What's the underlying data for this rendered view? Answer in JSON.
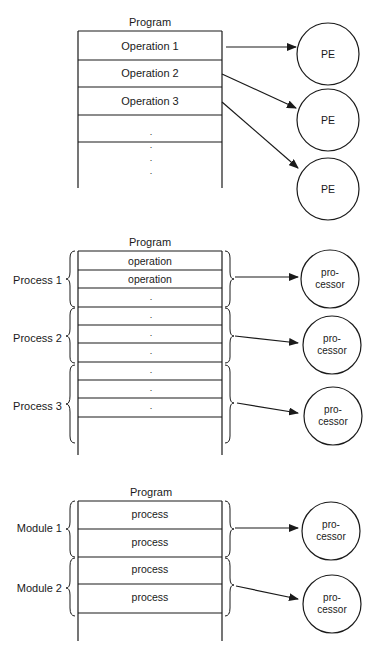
{
  "figure1": {
    "title": "Program",
    "rows": [
      "Operation 1",
      "Operation 2",
      "Operation 3",
      ".",
      ".",
      ".",
      "."
    ],
    "processors": [
      "PE",
      "PE",
      "PE"
    ]
  },
  "figure2": {
    "title": "Program",
    "groups": [
      "Process 1",
      "Process 2",
      "Process 3"
    ],
    "rows": [
      "operation",
      "operation",
      ".",
      ".",
      ".",
      ".",
      ".",
      ".",
      "."
    ],
    "processors": [
      {
        "line1": "pro-",
        "line2": "cessor"
      },
      {
        "line1": "pro-",
        "line2": "cessor"
      },
      {
        "line1": "pro-",
        "line2": "cessor"
      }
    ]
  },
  "figure3": {
    "title": "Program",
    "groups": [
      "Module 1",
      "Module 2"
    ],
    "rows": [
      "process",
      "process",
      "process",
      "process"
    ],
    "processors": [
      {
        "line1": "pro-",
        "line2": "cessor"
      },
      {
        "line1": "pro-",
        "line2": "cessor"
      }
    ]
  }
}
